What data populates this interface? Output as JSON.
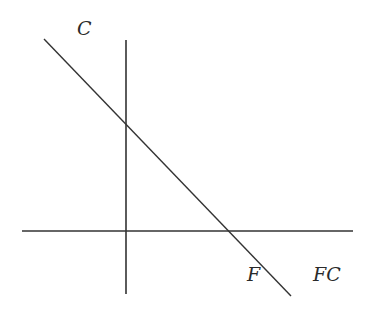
{
  "diagram": {
    "labels": {
      "y_axis": "C",
      "x_intercept": "F",
      "x_axis": "FC"
    },
    "colors": {
      "stroke": "#333333",
      "text": "#2a2a2a"
    },
    "elements": {
      "vertical_axis": {
        "x": 126,
        "y1": 40,
        "y2": 294
      },
      "horizontal_axis": {
        "y": 231,
        "x1": 22,
        "x2": 353
      },
      "budget_line": {
        "x1": 44,
        "y1": 39,
        "x2": 291,
        "y2": 296
      }
    }
  }
}
